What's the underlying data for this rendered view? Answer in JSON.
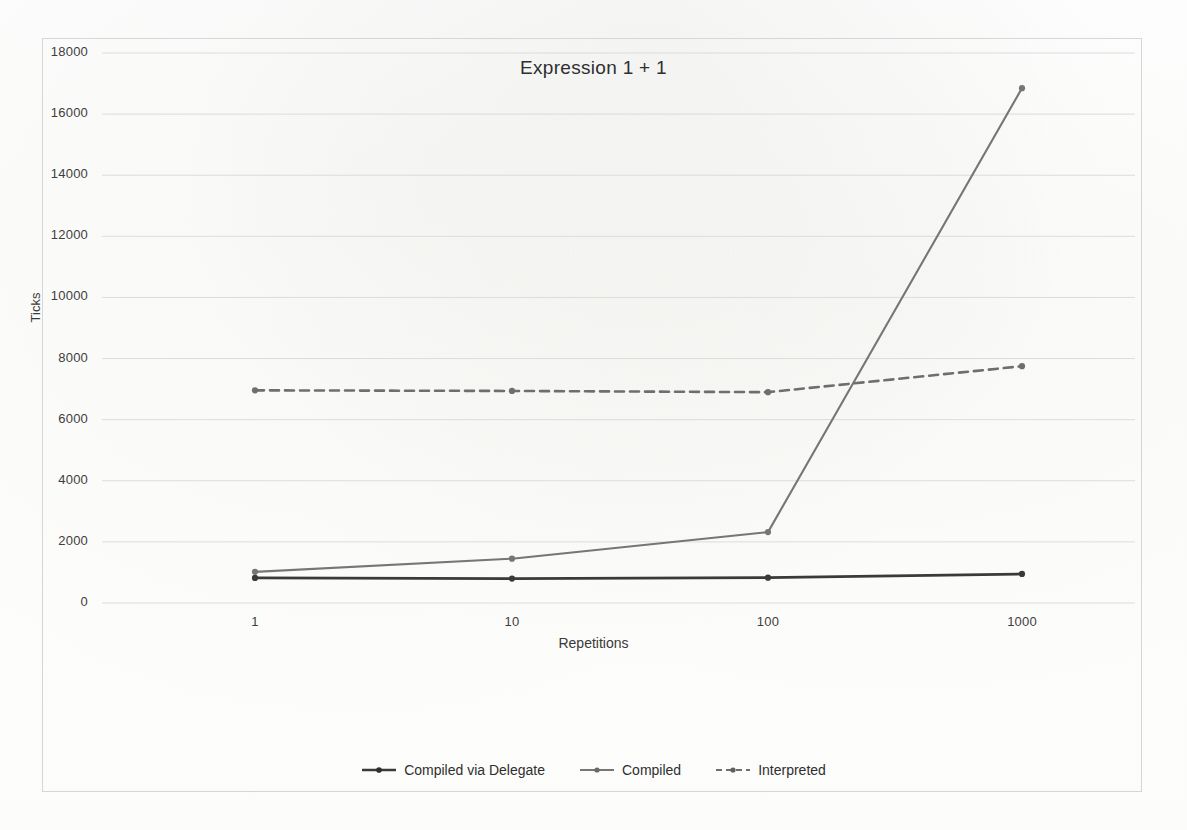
{
  "chart_data": {
    "type": "line",
    "title": "Expression 1 + 1",
    "xlabel": "Repetitions",
    "ylabel": "Ticks",
    "categories": [
      "1",
      "10",
      "100",
      "1000"
    ],
    "x_tick_labels": [
      "1",
      "10",
      "100",
      "1000"
    ],
    "y_tick_labels": [
      "0",
      "2000",
      "4000",
      "6000",
      "8000",
      "10000",
      "12000",
      "14000",
      "16000",
      "18000"
    ],
    "ylim": [
      0,
      18000
    ],
    "y_tick_step": 2000,
    "grid": "horizontal",
    "legend_position": "bottom",
    "series": [
      {
        "name": "Compiled via Delegate",
        "values": [
          820,
          800,
          830,
          950
        ],
        "color": "#3a3a3a",
        "style": "solid",
        "marker": "dot"
      },
      {
        "name": "Compiled",
        "values": [
          1020,
          1450,
          2320,
          16850
        ],
        "color": "#767676",
        "style": "solid",
        "marker": "dot"
      },
      {
        "name": "Interpreted",
        "values": [
          6960,
          6940,
          6900,
          7750
        ],
        "color": "#6e6e6e",
        "style": "dashed",
        "marker": "dot"
      }
    ]
  },
  "legend": {
    "entries": [
      {
        "label": "Compiled via Delegate"
      },
      {
        "label": "Compiled"
      },
      {
        "label": "Interpreted"
      }
    ]
  },
  "axes": {
    "y_title": "Ticks",
    "x_title": "Repetitions"
  },
  "title": "Expression 1 + 1",
  "colors": {
    "series_delegate": "#3a3a3a",
    "series_compiled": "#767676",
    "series_interpreted": "#6e6e6e",
    "gridline": "#dcdcdc",
    "frame": "#d6d6d6",
    "text": "#2f2f2f",
    "background": "#fdfdfc"
  }
}
